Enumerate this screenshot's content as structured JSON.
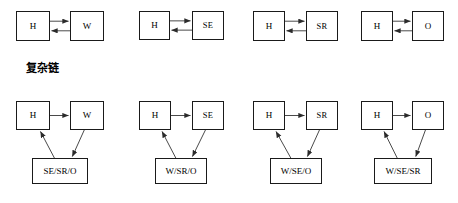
{
  "diagram": {
    "title_label": "复杂链",
    "stroke_color": "#1a1a1a",
    "arrow_color": "#3a3a3a",
    "background": "#ffffff",
    "simple_row": {
      "caption": "",
      "pairs": [
        {
          "source": "H",
          "target": "W",
          "relation": "bidirectional"
        },
        {
          "source": "H",
          "target": "SE",
          "relation": "bidirectional"
        },
        {
          "source": "H",
          "target": "SR",
          "relation": "bidirectional"
        },
        {
          "source": "H",
          "target": "O",
          "relation": "bidirectional"
        }
      ]
    },
    "complex_row": {
      "triads": [
        {
          "source": "H",
          "target": "W",
          "set": "SE/SR/O"
        },
        {
          "source": "H",
          "target": "SE",
          "set": "W/SR/O"
        },
        {
          "source": "H",
          "target": "SR",
          "set": "W/SE/O"
        },
        {
          "source": "H",
          "target": "O",
          "set": "W/SE/SR"
        }
      ]
    }
  }
}
